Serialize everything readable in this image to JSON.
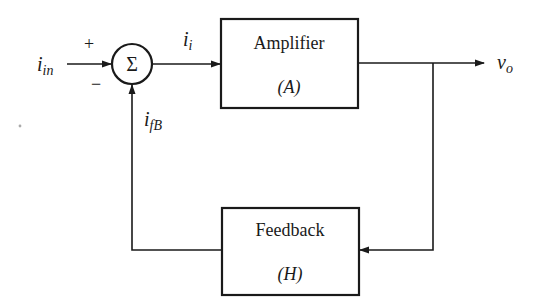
{
  "diagram": {
    "type": "feedback-block-diagram",
    "colors": {
      "stroke": "#1a1a1a",
      "background": "#ffffff"
    },
    "summing_junction": {
      "symbol": "Σ",
      "plus_sign": "+",
      "minus_sign": "−"
    },
    "signals": {
      "input": {
        "main": "i",
        "sub": "in"
      },
      "error": {
        "main": "i",
        "sub": "i"
      },
      "feedback": {
        "main": "i",
        "sub": "fB"
      },
      "output": {
        "main": "v",
        "sub": "o"
      }
    },
    "blocks": {
      "amplifier": {
        "label": "Amplifier",
        "symbol": "(A)"
      },
      "feedback": {
        "label": "Feedback",
        "symbol": "(H)"
      }
    }
  }
}
